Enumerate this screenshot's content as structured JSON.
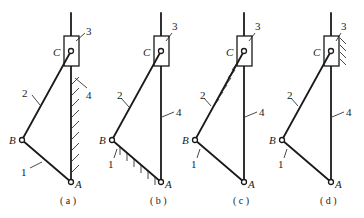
{
  "figures": [
    {
      "id": "a",
      "caption": "( a )",
      "fixed_link": "4",
      "labels": {
        "A": "A",
        "B": "B",
        "C": "C",
        "l1": "1",
        "l2": "2",
        "l3": "3",
        "l4": "4"
      }
    },
    {
      "id": "b",
      "caption": "( b )",
      "fixed_link": "1",
      "labels": {
        "A": "A",
        "B": "B",
        "C": "C",
        "l1": "1",
        "l2": "2",
        "l3": "3",
        "l4": "4"
      }
    },
    {
      "id": "c",
      "caption": "( c )",
      "fixed_link": "2",
      "labels": {
        "A": "A",
        "B": "B",
        "C": "C",
        "l1": "1",
        "l2": "2",
        "l3": "3",
        "l4": "4"
      }
    },
    {
      "id": "d",
      "caption": "( d )",
      "fixed_link": "3",
      "labels": {
        "A": "A",
        "B": "B",
        "C": "C",
        "l1": "1",
        "l2": "2",
        "l3": "3",
        "l4": "4"
      }
    }
  ],
  "colors": {
    "ink": "#1a1a1a",
    "background": "#ffffff"
  }
}
